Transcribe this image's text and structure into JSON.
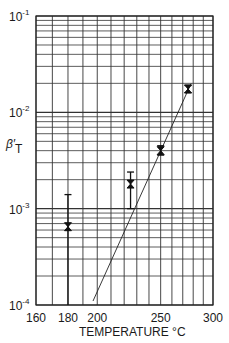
{
  "chart_data": {
    "type": "scatter",
    "title": "",
    "xlabel": "TEMPERATURE °C",
    "ylabel": "β′T",
    "xscale": "reciprocal-temperature",
    "yscale": "log",
    "xlim": [
      160,
      300
    ],
    "ylim": [
      0.0001,
      0.1
    ],
    "x_ticks": [
      160,
      180,
      200,
      250,
      300
    ],
    "x_tick_labels": [
      "160",
      "180",
      "200",
      "250",
      "300"
    ],
    "x_gridlines": [
      160,
      170,
      180,
      190,
      200,
      210,
      220,
      230,
      240,
      250,
      260,
      270,
      280,
      290,
      300
    ],
    "y_ticks": [
      0.1,
      0.01,
      0.001,
      0.0001
    ],
    "y_tick_labels": [
      {
        "base": "10",
        "exp": "-1"
      },
      {
        "base": "10",
        "exp": "-2"
      },
      {
        "base": "10",
        "exp": "-3"
      },
      {
        "base": "10",
        "exp": "-4"
      }
    ],
    "grid": true,
    "legend": null,
    "series": [
      {
        "name": "measured",
        "marker": "x-bar",
        "points": [
          {
            "x": 180,
            "y": 0.00065,
            "err_high": 0.0014,
            "err_low": 0.0001
          },
          {
            "x": 225,
            "y": 0.0018,
            "err_high": 0.0024,
            "err_low": 0.001
          },
          {
            "x": 250,
            "y": 0.004,
            "err_high": 0.0045,
            "err_low": 0.0036
          },
          {
            "x": 275,
            "y": 0.0175,
            "err_high": 0.019,
            "err_low": 0.016
          }
        ]
      },
      {
        "name": "fit",
        "type": "line",
        "points": [
          {
            "x": 197,
            "y": 0.00011
          },
          {
            "x": 278,
            "y": 0.02
          }
        ]
      }
    ]
  }
}
